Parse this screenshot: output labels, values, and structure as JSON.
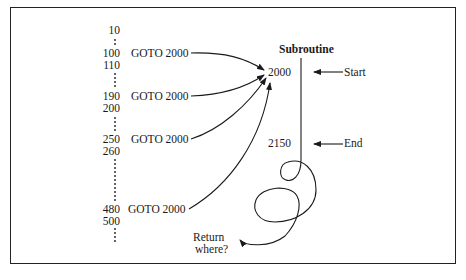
{
  "diagram": {
    "line_numbers": [
      {
        "label": "10",
        "y": 24
      },
      {
        "label": "100",
        "y": 47
      },
      {
        "label": "110",
        "y": 59
      },
      {
        "label": "190",
        "y": 90
      },
      {
        "label": "200",
        "y": 102
      },
      {
        "label": "250",
        "y": 133
      },
      {
        "label": "260",
        "y": 145
      },
      {
        "label": "480",
        "y": 203
      },
      {
        "label": "500",
        "y": 215
      }
    ],
    "goto_statements": [
      {
        "line": "100",
        "text": "GOTO 2000"
      },
      {
        "line": "190",
        "text": "GOTO 2000"
      },
      {
        "line": "250",
        "text": "GOTO 2000"
      },
      {
        "line": "480",
        "text": "GOTO 2000"
      }
    ],
    "subroutine": {
      "title": "Subroutine",
      "start_line": "2000",
      "end_line": "2150",
      "start_label": "Start",
      "end_label": "End"
    },
    "return_label_line1": "Return",
    "return_label_line2": "where?",
    "stroke_color": "#1a1a1a"
  }
}
